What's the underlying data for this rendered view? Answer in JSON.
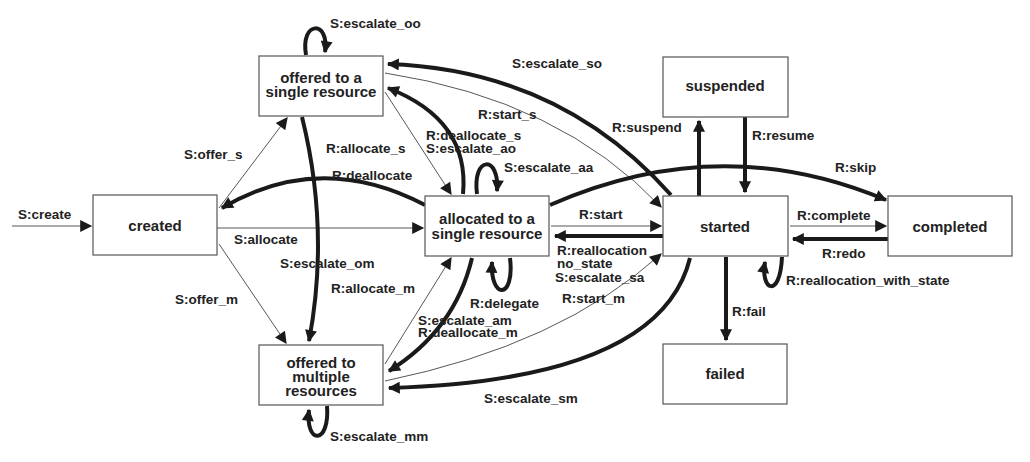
{
  "diagram": {
    "type": "state-transition",
    "states": {
      "created": "created",
      "offered_single_l1": "offered to a",
      "offered_single_l2": "single resource",
      "allocated_l1": "allocated to a",
      "allocated_l2": "single resource",
      "offered_multi_l1": "offered to",
      "offered_multi_l2": "multiple",
      "offered_multi_l3": "resources",
      "suspended": "suspended",
      "started": "started",
      "completed": "completed",
      "failed": "failed"
    },
    "transitions": {
      "create": "S:create",
      "offer_s": "S:offer_s",
      "offer_m": "S:offer_m",
      "allocate": "S:allocate",
      "deallocate": "R:deallocate",
      "escalate_oo": "S:escalate_oo",
      "escalate_so": "S:escalate_so",
      "start_s": "R:start_s",
      "allocate_s": "R:allocate_s",
      "deallocate_s": "R:deallocate_s",
      "escalate_ao": "S:escalate_ao",
      "escalate_aa": "S:escalate_aa",
      "escalate_om": "S:escalate_om",
      "allocate_m": "R:allocate_m",
      "start": "R:start",
      "reallocation_l1": "R:reallocation",
      "reallocation_l2": "no_state",
      "escalate_sa": "S:escalate_sa",
      "start_m": "R:start_m",
      "delegate": "R:delegate",
      "escalate_am": "S:escalate_am",
      "deallocate_m": "R:deallocate_m",
      "escalate_sm": "S:escalate_sm",
      "escalate_mm": "S:escalate_mm",
      "suspend": "R:suspend",
      "resume": "R:resume",
      "skip": "R:skip",
      "complete": "R:complete",
      "redo": "R:redo",
      "reallocation_with_state": "R:reallocation_with_state",
      "fail": "R:fail"
    }
  }
}
